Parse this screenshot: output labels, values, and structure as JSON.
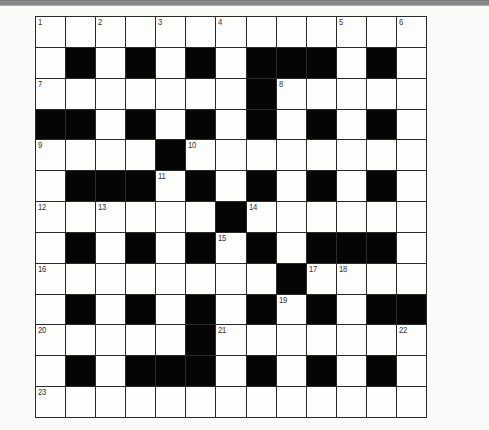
{
  "puzzle": {
    "rows": 13,
    "cols": 13,
    "grid": [
      "WWWWWWWWWWWWW",
      "WBWBWBWBBBWBW",
      "WWWWWWWBWWWWW",
      "BBWBWBWBWBWBW",
      "WWWWBWWWWWWWW",
      "WBBBWBWBWBWBW",
      "WWWWWWBWWWWWW",
      "WBWBWBWBWBBBW",
      "WWWWWWWWBWWWW",
      "WBWBWBWBWBWBB",
      "WWWWWBWWWWWWW",
      "WBWBBBWBWBWBW",
      "WWWWWWWWWWWWW"
    ],
    "numbers": [
      {
        "row": 0,
        "col": 0,
        "n": "1"
      },
      {
        "row": 0,
        "col": 2,
        "n": "2"
      },
      {
        "row": 0,
        "col": 4,
        "n": "3"
      },
      {
        "row": 0,
        "col": 6,
        "n": "4"
      },
      {
        "row": 0,
        "col": 10,
        "n": "5"
      },
      {
        "row": 0,
        "col": 12,
        "n": "6"
      },
      {
        "row": 2,
        "col": 0,
        "n": "7"
      },
      {
        "row": 2,
        "col": 8,
        "n": "8"
      },
      {
        "row": 4,
        "col": 0,
        "n": "9"
      },
      {
        "row": 4,
        "col": 5,
        "n": "10"
      },
      {
        "row": 5,
        "col": 4,
        "n": "11"
      },
      {
        "row": 6,
        "col": 0,
        "n": "12"
      },
      {
        "row": 6,
        "col": 2,
        "n": "13"
      },
      {
        "row": 6,
        "col": 7,
        "n": "14"
      },
      {
        "row": 7,
        "col": 6,
        "n": "15"
      },
      {
        "row": 8,
        "col": 0,
        "n": "16"
      },
      {
        "row": 8,
        "col": 9,
        "n": "17"
      },
      {
        "row": 8,
        "col": 10,
        "n": "18"
      },
      {
        "row": 9,
        "col": 8,
        "n": "19"
      },
      {
        "row": 10,
        "col": 0,
        "n": "20"
      },
      {
        "row": 10,
        "col": 6,
        "n": "21"
      },
      {
        "row": 10,
        "col": 12,
        "n": "22"
      },
      {
        "row": 12,
        "col": 0,
        "n": "23"
      }
    ],
    "colors": {
      "block": "#050505",
      "cell": "#fdfdfc",
      "line": "#2a2a2a",
      "background": "#fafaf8"
    }
  }
}
